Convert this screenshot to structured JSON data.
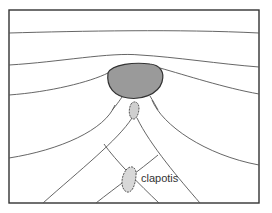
{
  "diagram": {
    "type": "wave refraction around an island",
    "labels": {
      "clapotis": "clapotis"
    },
    "colors": {
      "island_fill": "#9a9a9a",
      "island_stroke": "#333333",
      "line": "#555555",
      "frame": "#333333",
      "background": "#ffffff"
    },
    "elements": [
      "frame",
      "wave-crest-1",
      "wave-crest-2",
      "wave-crest-3",
      "wave-crest-left-4",
      "wave-crest-right-4",
      "island",
      "small-rock-shoal",
      "crossing-wave-fronts",
      "clapotis-zone"
    ]
  }
}
